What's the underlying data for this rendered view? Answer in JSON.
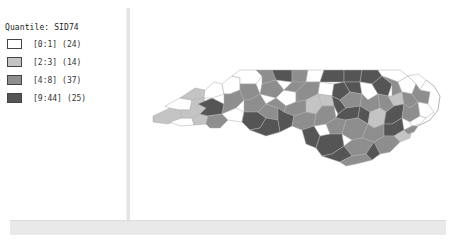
{
  "legend": {
    "title": "Quantile: SID74",
    "classes": [
      {
        "label": "[0:1]",
        "count": "(24)",
        "color": "#ffffff"
      },
      {
        "label": "[2:3]",
        "count": "(14)",
        "color": "#c4c4c4"
      },
      {
        "label": "[4:8]",
        "count": "(37)",
        "color": "#8e8e8e"
      },
      {
        "label": "[9:44]",
        "count": "(25)",
        "color": "#555555"
      }
    ]
  },
  "map": {
    "region": "North Carolina counties",
    "variable": "SID74",
    "classification": "Quantile",
    "border_color": "#b0b0b0"
  }
}
